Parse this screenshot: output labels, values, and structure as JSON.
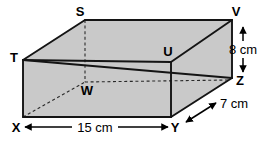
{
  "diagram": {
    "shape": "cuboid",
    "fill_color": "#c9c9c9",
    "edge_color": "#1a1a1a",
    "hidden_edge_style": "dashed",
    "background_color": "#ffffff",
    "vertices": [
      {
        "id": "S",
        "label": "S",
        "hidden": false
      },
      {
        "id": "V",
        "label": "V",
        "hidden": false
      },
      {
        "id": "T",
        "label": "T",
        "hidden": false
      },
      {
        "id": "U",
        "label": "U",
        "hidden": false
      },
      {
        "id": "W",
        "label": "W",
        "hidden": true
      },
      {
        "id": "Z",
        "label": "Z",
        "hidden": false
      },
      {
        "id": "X",
        "label": "X",
        "hidden": false
      },
      {
        "id": "Y",
        "label": "Y",
        "hidden": false
      }
    ],
    "dimensions": [
      {
        "id": "height",
        "label": "8 cm",
        "value": 8,
        "unit": "cm",
        "orientation": "vertical",
        "edge": "VZ"
      },
      {
        "id": "depth",
        "label": "7 cm",
        "value": 7,
        "unit": "cm",
        "orientation": "diagonal",
        "edge": "YZ"
      },
      {
        "id": "width",
        "label": "15 cm",
        "value": 15,
        "unit": "cm",
        "orientation": "horizontal",
        "edge": "XY"
      }
    ]
  }
}
